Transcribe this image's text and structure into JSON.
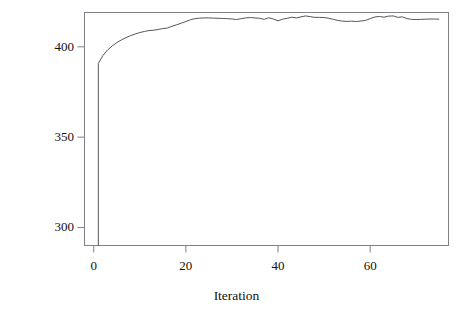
{
  "chart_data": {
    "type": "line",
    "title": "",
    "xlabel": "Iteration",
    "ylabel": "Negative AIC",
    "xlim": [
      -2,
      77
    ],
    "ylim": [
      290,
      419
    ],
    "xticks": [
      0,
      20,
      40,
      60
    ],
    "xticklabels": [
      "0",
      "20",
      "40",
      "60"
    ],
    "yticks": [
      300,
      350,
      400
    ],
    "yticklabels": [
      "300",
      "350",
      "400"
    ],
    "grid": false,
    "legend": null,
    "line_color": "#55555a",
    "frame_color": "#808088",
    "series": [
      {
        "name": "Negative AIC",
        "x": [
          1,
          1,
          2,
          3,
          4,
          5,
          6,
          7,
          8,
          9,
          10,
          11,
          12,
          13,
          14,
          15,
          16,
          17,
          18,
          19,
          20,
          21,
          22,
          23,
          24,
          25,
          26,
          27,
          28,
          29,
          30,
          31,
          32,
          33,
          34,
          35,
          36,
          37,
          38,
          39,
          40,
          41,
          42,
          43,
          44,
          45,
          46,
          47,
          48,
          49,
          50,
          51,
          52,
          53,
          54,
          55,
          56,
          57,
          58,
          59,
          60,
          61,
          62,
          63,
          64,
          65,
          66,
          67,
          68,
          69,
          70,
          71,
          72,
          73,
          74,
          75
        ],
        "y": [
          290.0,
          390.8,
          395.2,
          398.2,
          400.5,
          402.3,
          403.8,
          405.1,
          406.2,
          407.1,
          407.9,
          408.5,
          409.0,
          409.2,
          409.6,
          410.1,
          410.4,
          411.4,
          412.2,
          413.1,
          414.0,
          415.0,
          415.6,
          415.9,
          416.0,
          416.0,
          415.9,
          415.8,
          415.7,
          415.6,
          415.4,
          415.1,
          415.6,
          416.0,
          416.2,
          416.0,
          415.8,
          415.2,
          416.1,
          415.4,
          414.4,
          415.3,
          415.8,
          416.4,
          416.0,
          416.6,
          417.1,
          416.7,
          416.3,
          416.3,
          416.2,
          415.8,
          415.2,
          414.6,
          414.2,
          414.1,
          414.2,
          414.0,
          414.3,
          414.6,
          415.6,
          416.5,
          416.8,
          416.4,
          417.0,
          417.1,
          416.3,
          416.6,
          415.6,
          415.2,
          415.1,
          415.2,
          415.3,
          415.4,
          415.4,
          415.3
        ]
      }
    ]
  },
  "axes": {
    "x_title": "Iteration",
    "y_title": "Negative AIC"
  }
}
